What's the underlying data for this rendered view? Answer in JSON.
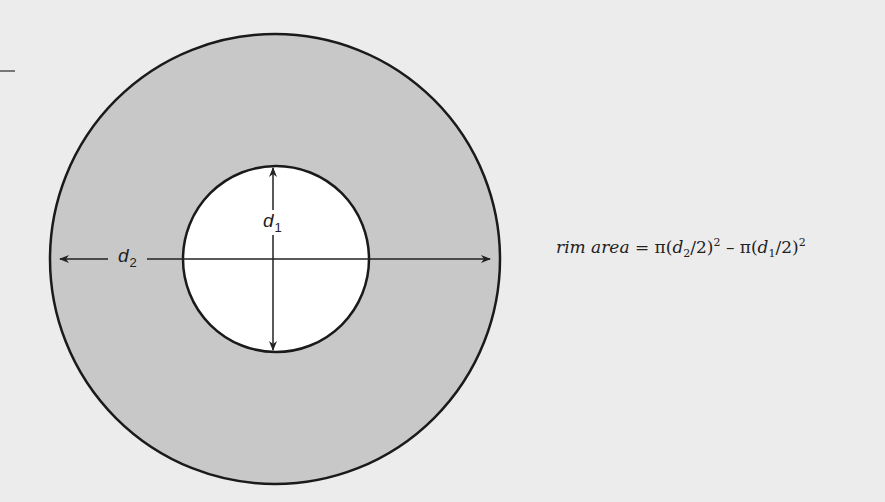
{
  "diagram": {
    "outer_circle": {
      "cx": 275,
      "cy": 259,
      "r": 225,
      "fill": "#c8c8c8"
    },
    "inner_circle": {
      "cx": 276,
      "cy": 259,
      "r": 93,
      "fill": "#ffffff"
    },
    "labels": {
      "d1": "d",
      "d1_sub": "1",
      "d2": "d",
      "d2_sub": "2"
    },
    "formula": {
      "lhs": "rim area",
      "eq": " = π(",
      "d2": "d",
      "d2_sub": "2",
      "mid1": "/2)",
      "sq1": "2",
      "minus": " – π(",
      "d1": "d",
      "d1_sub": "1",
      "mid2": "/2)",
      "sq2": "2"
    }
  }
}
